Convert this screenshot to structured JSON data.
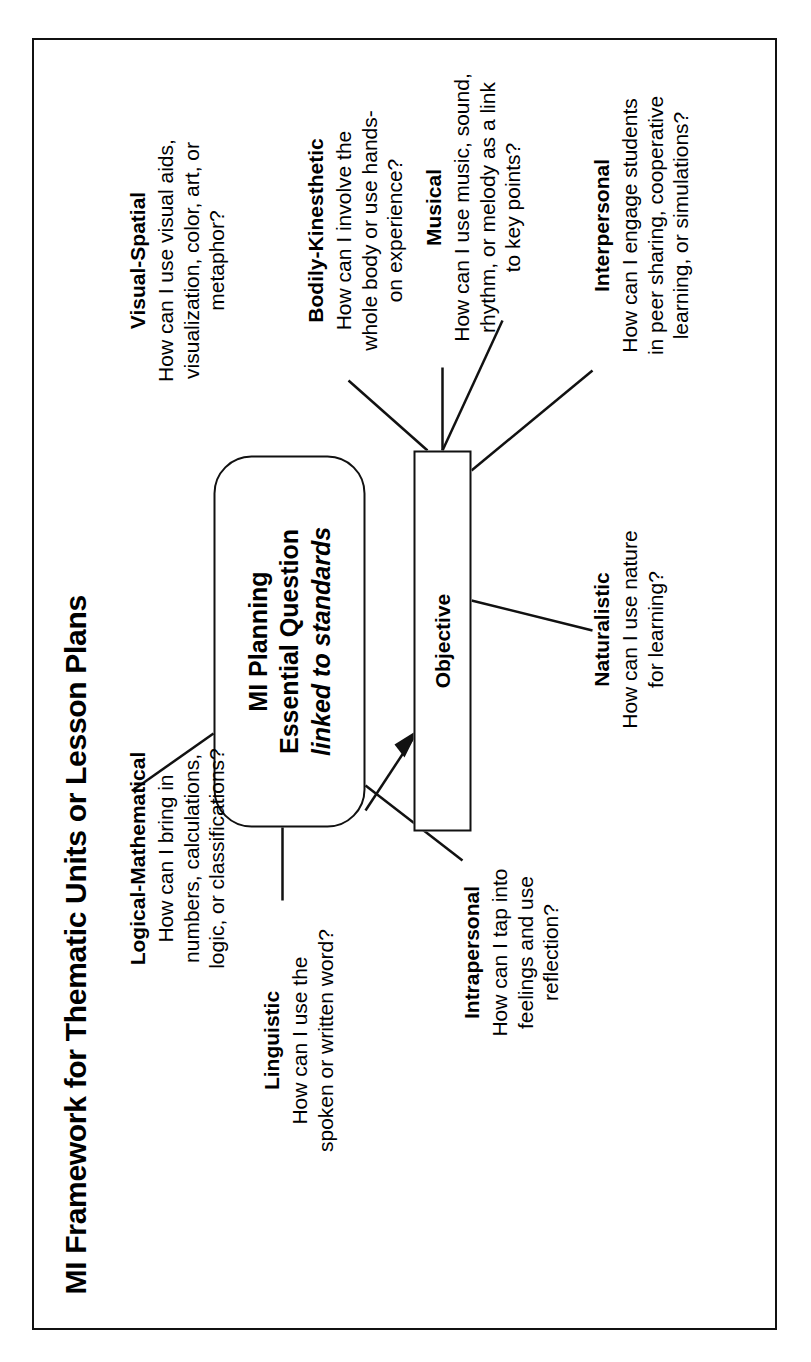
{
  "document": {
    "title": "MI Framework for Thematic Units or Lesson Plans"
  },
  "center": {
    "line1": "MI Planning",
    "line2": "Essential Question",
    "line3": "linked to standards"
  },
  "objective": {
    "label": "Objective"
  },
  "branches": {
    "logical_mathematical": {
      "title": "Logical-Mathematical",
      "l1": "How can I bring in",
      "l2": "numbers, calculations,",
      "l3": "logic, or classifications?"
    },
    "visual_spatial": {
      "title": "Visual-Spatial",
      "l1": "How can I use visual aids,",
      "l2": "visualization, color, art, or",
      "l3": "metaphor?"
    },
    "bodily_kinesthetic": {
      "title": "Bodily-Kinesthetic",
      "l1": "How can I involve the",
      "l2": "whole body or use hands-",
      "l3": "on experience?"
    },
    "musical": {
      "title": "Musical",
      "l1": "How can I use music, sound,",
      "l2": "rhythm, or melody as a link",
      "l3": "to key points?"
    },
    "interpersonal": {
      "title": "Interpersonal",
      "l1": "How can I engage students",
      "l2": "in peer sharing, cooperative",
      "l3": "learning, or simulations?"
    },
    "naturalistic": {
      "title": "Naturalistic",
      "l1": "How can I use nature",
      "l2": "for learning?",
      "l3": ""
    },
    "intrapersonal": {
      "title": "Intrapersonal",
      "l1": "How can I tap into",
      "l2": "feelings and use",
      "l3": "reflection?"
    },
    "linguistic": {
      "title": "Linguistic",
      "l1": "How can I use the",
      "l2": "spoken or written word?",
      "l3": ""
    }
  },
  "colors": {
    "ink": "#111111",
    "paper": "#ffffff"
  }
}
